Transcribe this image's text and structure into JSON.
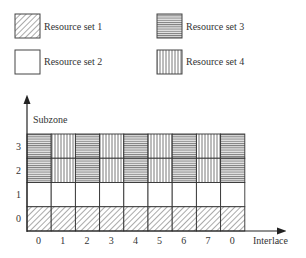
{
  "legend": [
    {
      "label": "Resource set 1",
      "pattern": "diagonal"
    },
    {
      "label": "Resource set 2",
      "pattern": "blank"
    },
    {
      "label": "Resource set 3",
      "pattern": "horizontal"
    },
    {
      "label": "Resource set 4",
      "pattern": "vertical"
    }
  ],
  "axes": {
    "y_label": "Subzone",
    "x_label": "Interlace",
    "y_ticks": [
      "0",
      "1",
      "2",
      "3"
    ],
    "x_ticks": [
      "0",
      "1",
      "2",
      "3",
      "4",
      "5",
      "6",
      "7",
      "0"
    ]
  },
  "grid": {
    "rows_top_to_bottom": [
      {
        "subzone": "3",
        "cells": [
          "horizontal",
          "vertical",
          "horizontal",
          "vertical",
          "horizontal",
          "vertical",
          "horizontal",
          "vertical",
          "horizontal"
        ]
      },
      {
        "subzone": "2",
        "cells": [
          "horizontal",
          "vertical",
          "horizontal",
          "vertical",
          "horizontal",
          "vertical",
          "horizontal",
          "vertical",
          "horizontal"
        ]
      },
      {
        "subzone": "1",
        "cells": [
          "blank",
          "blank",
          "blank",
          "blank",
          "blank",
          "blank",
          "blank",
          "blank",
          "blank"
        ]
      },
      {
        "subzone": "0",
        "cells": [
          "diagonal",
          "diagonal",
          "diagonal",
          "diagonal",
          "diagonal",
          "diagonal",
          "diagonal",
          "diagonal",
          "diagonal"
        ]
      }
    ]
  }
}
